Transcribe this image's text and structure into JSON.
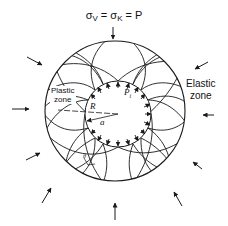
{
  "title": {
    "sigma_v": "σ",
    "sub_v": "V",
    "eq1": " = σ",
    "sub_k": "K",
    "eq2": " = P"
  },
  "labels": {
    "elastic_line1": "Elastic",
    "elastic_line2": "zone",
    "plastic_line1": "Plastic",
    "plastic_line2": "zone",
    "outer_radius": "R",
    "inner_radius": "a",
    "internal_pressure": "P",
    "internal_pressure_sub": "i",
    "slip_angle": "θ"
  },
  "geometry": {
    "outer_circle": {
      "cx": 115,
      "cy": 111,
      "r": 70
    },
    "inner_circle": {
      "cx": 118,
      "cy": 114,
      "r": 33
    }
  },
  "colors": {
    "line": "#1a1a1a",
    "background": "#ffffff"
  }
}
